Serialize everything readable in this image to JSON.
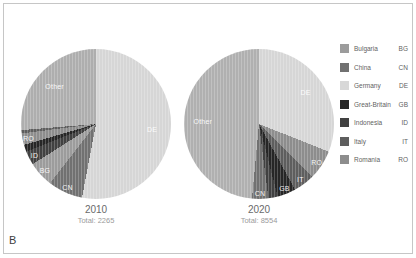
{
  "panel_label": "B",
  "legend": {
    "items": [
      {
        "name": "Bulgaria",
        "code": "BG",
        "color": "#9c9c9c",
        "pattern": "solid"
      },
      {
        "name": "China",
        "code": "CN",
        "color": "#717171",
        "pattern": "solid"
      },
      {
        "name": "Germany",
        "code": "DE",
        "color": "#d8d8d8",
        "pattern": "stripes"
      },
      {
        "name": "Great-Britain",
        "code": "GB",
        "color": "#262626",
        "pattern": "solid"
      },
      {
        "name": "Indonesia",
        "code": "ID",
        "color": "#414141",
        "pattern": "solid"
      },
      {
        "name": "Italy",
        "code": "IT",
        "color": "#5e5e5e",
        "pattern": "solid"
      },
      {
        "name": "Romania",
        "code": "RO",
        "color": "#8d8d8d",
        "pattern": "cross"
      }
    ]
  },
  "chart_data": [
    {
      "type": "pie",
      "title": "2010",
      "subtitle": "Total: 2265",
      "total": 2265,
      "order": "clockwise-from-top",
      "slices": [
        {
          "label": "DE",
          "country": "Germany",
          "value_pct": 53.0,
          "color": "#d6d6d6",
          "labeled": true
        },
        {
          "label": "CN",
          "country": "China",
          "value_pct": 7.5,
          "color": "#717171",
          "labeled": true
        },
        {
          "label": "BG",
          "country": "Bulgaria",
          "value_pct": 5.5,
          "color": "#9c9c9c",
          "labeled": true
        },
        {
          "label": "ID",
          "country": "Indonesia",
          "value_pct": 3.0,
          "color": "#414141",
          "labeled": true
        },
        {
          "label": "GB",
          "country": "Great-Britain",
          "value_pct": 1.5,
          "color": "#262626",
          "labeled": false
        },
        {
          "label": "RO",
          "country": "Romania",
          "value_pct": 2.5,
          "color": "#8d8d8d",
          "labeled": true
        },
        {
          "label": "IT",
          "country": "Italy",
          "value_pct": 0.7,
          "color": "#5e5e5e",
          "labeled": false
        },
        {
          "label": "Other",
          "country": "Other",
          "value_pct": 26.3,
          "color": "#aeaeae",
          "labeled": true
        }
      ]
    },
    {
      "type": "pie",
      "title": "2020",
      "subtitle": "Total: 8554",
      "total": 8554,
      "order": "clockwise-from-top",
      "slices": [
        {
          "label": "DE",
          "country": "Germany",
          "value_pct": 31.0,
          "color": "#d6d6d6",
          "labeled": true
        },
        {
          "label": "RO",
          "country": "Romania",
          "value_pct": 6.5,
          "color": "#8d8d8d",
          "labeled": true
        },
        {
          "label": "IT",
          "country": "Italy",
          "value_pct": 4.5,
          "color": "#5e5e5e",
          "labeled": true
        },
        {
          "label": "GB",
          "country": "Great-Britain",
          "value_pct": 4.0,
          "color": "#262626",
          "labeled": true
        },
        {
          "label": "ID",
          "country": "Indonesia",
          "value_pct": 2.0,
          "color": "#414141",
          "labeled": false
        },
        {
          "label": "CN",
          "country": "China",
          "value_pct": 3.5,
          "color": "#717171",
          "labeled": true
        },
        {
          "label": "Other",
          "country": "Other",
          "value_pct": 48.5,
          "color": "#b0b0b0",
          "labeled": true
        }
      ]
    }
  ]
}
